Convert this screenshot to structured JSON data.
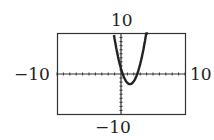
{
  "chart_data": {
    "type": "line",
    "title": "",
    "xlabel": "",
    "ylabel": "",
    "xlim": [
      -10,
      10
    ],
    "ylim": [
      -10,
      10
    ],
    "tick_labels": {
      "ymax": "10",
      "ymin": "−10",
      "xmin": "−10",
      "xmax": "10"
    },
    "grid": false,
    "series": [
      {
        "name": "curve",
        "x": [
          -1.1,
          -0.5,
          0,
          0.7,
          1.4,
          2.1,
          2.7,
          3.5,
          4.2
        ],
        "y": [
          10,
          3,
          0,
          -1.9,
          -2.5,
          -1.9,
          0,
          4.5,
          10
        ]
      }
    ],
    "tick_marks": {
      "x_step": 1,
      "y_step": 1
    }
  }
}
